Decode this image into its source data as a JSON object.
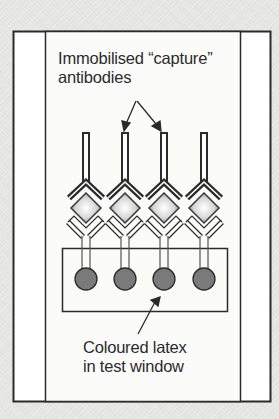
{
  "figure": {
    "labels": {
      "capture_antibodies": {
        "line1": "Immobilised “capture”",
        "line2": "antibodies"
      },
      "coloured_latex": {
        "line1": "Coloured latex",
        "line2": "in test window"
      }
    },
    "antibody_count": 4,
    "latex_particle_count": 4,
    "colors": {
      "background": "#e6e6e4",
      "strip": "#ffffff",
      "outline": "#2b2b2b",
      "latex": "#7a7a7a",
      "antigen_center": "#ffffff",
      "antigen_edge": "#9a9a9a"
    }
  }
}
